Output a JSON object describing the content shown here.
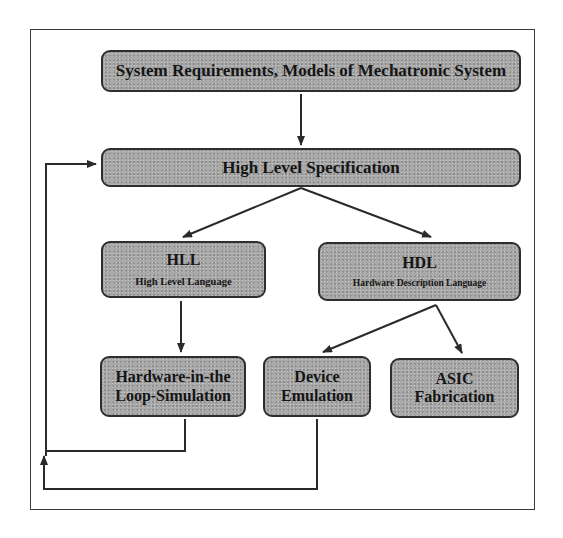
{
  "diagram": {
    "nodes": {
      "requirements": {
        "label": "System Requirements, Models of Mechatronic System"
      },
      "spec": {
        "label": "High Level Specification"
      },
      "hll": {
        "label": "HLL",
        "sublabel": "High Level Language"
      },
      "hdl": {
        "label": "HDL",
        "sublabel": "Hardware Description Language"
      },
      "hil": {
        "line1": "Hardware-in-the",
        "line2": "Loop-Simulation"
      },
      "emulation": {
        "line1": "Device",
        "line2": "Emulation"
      },
      "asic": {
        "line1": "ASIC",
        "line2": "Fabrication"
      }
    },
    "edges": [
      {
        "from": "requirements",
        "to": "spec"
      },
      {
        "from": "spec",
        "to": "hll"
      },
      {
        "from": "spec",
        "to": "hdl"
      },
      {
        "from": "hll",
        "to": "hil"
      },
      {
        "from": "hdl",
        "to": "emulation"
      },
      {
        "from": "hdl",
        "to": "asic"
      },
      {
        "from": "hil",
        "to": "spec",
        "type": "feedback"
      },
      {
        "from": "emulation",
        "to": "spec",
        "type": "feedback"
      }
    ],
    "colors": {
      "node_fill": "#a9a9a9",
      "node_border": "#2e2e2e",
      "line": "#2a2a2a"
    }
  }
}
